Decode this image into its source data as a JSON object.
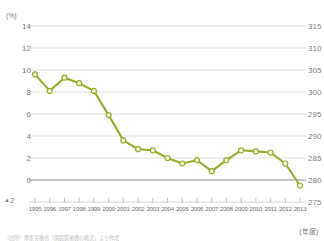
{
  "chart_data": {
    "type": "line",
    "title": "",
    "xlabel": "(年度)",
    "ylabel": "(%)",
    "x": [
      "1995",
      "1996",
      "1997",
      "1998",
      "1999",
      "2000",
      "2001",
      "2002",
      "2003",
      "2004",
      "2005",
      "2006",
      "2007",
      "2008",
      "2009",
      "2010",
      "2011",
      "2012",
      "2013"
    ],
    "series": [
      {
        "name": "伸び率",
        "axis": "left",
        "values": [
          9.6,
          8.1,
          9.3,
          8.8,
          8.1,
          5.9,
          3.6,
          2.8,
          2.7,
          2.0,
          1.5,
          1.8,
          0.8,
          1.8,
          2.7,
          2.6,
          2.5,
          1.5,
          -0.5
        ]
      }
    ],
    "axes": {
      "left": {
        "unit": "(%)",
        "ticks": [
          "14",
          "12",
          "10",
          "8",
          "6",
          "4",
          "2",
          "0"
        ],
        "tick_values": [
          14,
          12,
          10,
          8,
          6,
          4,
          2,
          0
        ],
        "min": -2,
        "max": 14,
        "below_axis_label": "2",
        "below_axis_marker": "▲"
      },
      "right": {
        "ticks": [
          "315",
          "310",
          "305",
          "300",
          "295",
          "290",
          "285",
          "280",
          "275"
        ],
        "tick_values": [
          315,
          310,
          305,
          300,
          295,
          290,
          285,
          280,
          275
        ],
        "min": 275,
        "max": 315
      }
    },
    "grid": true,
    "legend_position": "none",
    "colors": {
      "line": "#9aaa2b",
      "marker_fill": "#fbf7e0",
      "marker_stroke": "#9aaa2b",
      "grid": "#d8d8d8",
      "zero_axis": "#8a8a8a",
      "text": "#7a7a7a"
    }
  },
  "footnote": "（出所）厚生労働省「国民医療費の概況」より作成",
  "xaxis_caption": "(年度)"
}
